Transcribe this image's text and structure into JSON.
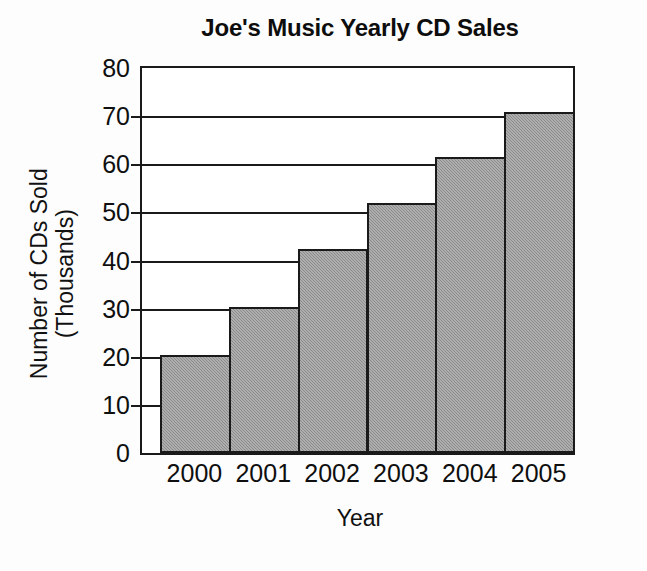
{
  "chart_data": {
    "type": "bar",
    "title": "Joe's Music Yearly CD Sales",
    "xlabel": "Year",
    "ylabel": "Number of CDs Sold (Thousands)",
    "ylabel_line1": "Number of CDs Sold",
    "ylabel_line2": "(Thousands)",
    "categories": [
      "2000",
      "2001",
      "2002",
      "2003",
      "2004",
      "2005"
    ],
    "values": [
      20,
      30,
      42,
      51.5,
      61,
      70.5
    ],
    "ylim": [
      0,
      80
    ],
    "ytick_step": 10,
    "yticks": [
      "80",
      "70",
      "60",
      "50",
      "40",
      "30",
      "20",
      "10",
      "0"
    ],
    "ytick_values": [
      80,
      70,
      60,
      50,
      40,
      30,
      20,
      10,
      0
    ],
    "grid": true,
    "grid_axis": "y",
    "legend": null,
    "bar_fill_color": "#8b8b8b",
    "bar_edge_color": "#1a1a1a",
    "axis_color": "#1a1a1a",
    "background_color": "#ffffff"
  }
}
